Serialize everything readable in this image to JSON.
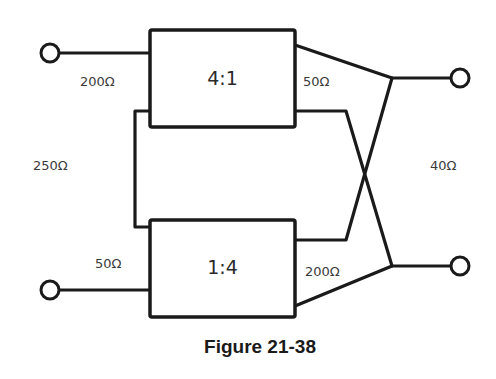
{
  "figure": {
    "caption": "Figure 21-38",
    "transformers": [
      {
        "id": "top",
        "ratio": "4:1",
        "input_impedance": "200Ω",
        "output_impedance": "50Ω"
      },
      {
        "id": "bottom",
        "ratio": "1:4",
        "input_impedance": "50Ω",
        "output_impedance": "200Ω"
      }
    ],
    "series_link_impedance": "250Ω",
    "load_impedance": "40Ω"
  }
}
